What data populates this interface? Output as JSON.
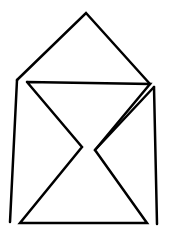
{
  "diagram": {
    "width": 169,
    "height": 233,
    "background": "#ffffff",
    "stroke_color": "#000000",
    "stroke_width": 2.5,
    "shapes": {
      "roof": {
        "points": [
          [
            17,
            80
          ],
          [
            86,
            13
          ],
          [
            150,
            84
          ]
        ]
      },
      "left_wall": {
        "points": [
          [
            17,
            80
          ],
          [
            10,
            222
          ]
        ]
      },
      "right_wall": {
        "points": [
          [
            154,
            87
          ],
          [
            157,
            224
          ]
        ]
      },
      "hourglass": {
        "points": [
          [
            27,
            82
          ],
          [
            150,
            84
          ],
          [
            95,
            150
          ],
          [
            147,
            223
          ],
          [
            20,
            223
          ],
          [
            82,
            147
          ],
          [
            27,
            82
          ]
        ]
      },
      "right_diagonal_upper": {
        "points": [
          [
            154,
            87
          ],
          [
            95,
            150
          ]
        ]
      }
    }
  }
}
